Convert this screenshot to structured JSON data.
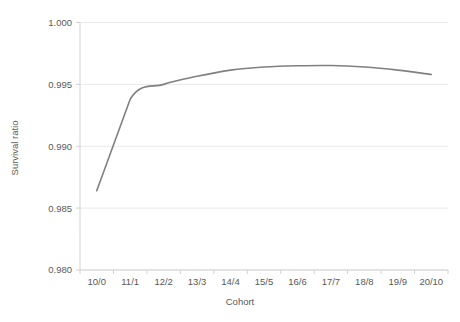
{
  "chart_data": {
    "type": "line",
    "title": "",
    "xlabel": "Cohort",
    "ylabel": "Survival ratio",
    "categories": [
      "10/0",
      "11/1",
      "12/2",
      "13/3",
      "14/4",
      "15/5",
      "16/6",
      "17/7",
      "18/8",
      "19/9",
      "20/10"
    ],
    "values": [
      0.9864,
      0.9938,
      0.995,
      0.99565,
      0.99615,
      0.9964,
      0.9965,
      0.99652,
      0.9964,
      0.99615,
      0.9958
    ],
    "series": [
      {
        "name": "Survival ratio",
        "values": [
          0.9864,
          0.9938,
          0.995,
          0.99565,
          0.99615,
          0.9964,
          0.9965,
          0.99652,
          0.9964,
          0.99615,
          0.9958
        ]
      }
    ],
    "ylim": [
      0.98,
      1.0
    ],
    "ytick_labels": [
      "1.000",
      "0.995",
      "0.990",
      "0.985",
      "0.980"
    ],
    "ytick_values": [
      1.0,
      0.995,
      0.99,
      0.985,
      0.98
    ],
    "xtick_labels": [
      "10/0",
      "11/1",
      "12/2",
      "13/3",
      "14/4",
      "15/5",
      "16/6",
      "17/7",
      "18/8",
      "19/9",
      "20/10"
    ],
    "grid": true,
    "legend": false,
    "legend_position": "none",
    "line_color": "#808080",
    "grid_color": "#e9e9e9",
    "axis_color": "#d2d2d2",
    "text_color": "#595959"
  }
}
